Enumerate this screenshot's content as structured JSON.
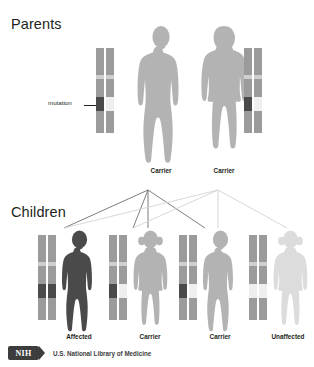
{
  "diagram": {
    "title_parents": "Parents",
    "title_children": "Children",
    "mutation_label": "mutation",
    "colors": {
      "chromosome_body": "#9b9b9b",
      "centromere_band": "#cfcfcf",
      "mutant_allele": "#4a4a4a",
      "normal_allele": "#efefef",
      "figure_carrier": "#b3b3b3",
      "figure_affected": "#4a4a4a",
      "figure_unaffected": "#dcdcdc",
      "line_dark": "#6e6e6e",
      "line_light": "#d2d2d2",
      "text": "#231f20",
      "nih_logo": "#3d3d3d"
    },
    "parents": [
      {
        "id": "father",
        "label": "Carrier",
        "sex": "male",
        "figure_shade": "carrier",
        "chromosomes": [
          {
            "allele": "mutation"
          },
          {
            "allele": "normal"
          }
        ]
      },
      {
        "id": "mother",
        "label": "Carrier",
        "sex": "female",
        "figure_shade": "carrier",
        "chromosomes": [
          {
            "allele": "mutation"
          },
          {
            "allele": "normal"
          }
        ]
      }
    ],
    "children": [
      {
        "id": "child-1",
        "label": "Affected",
        "sex": "male",
        "figure_shade": "affected",
        "chromosomes": [
          {
            "allele": "mutation"
          },
          {
            "allele": "mutation"
          }
        ]
      },
      {
        "id": "child-2",
        "label": "Carrier",
        "sex": "female",
        "figure_shade": "carrier",
        "chromosomes": [
          {
            "allele": "mutation"
          },
          {
            "allele": "normal"
          }
        ]
      },
      {
        "id": "child-3",
        "label": "Carrier",
        "sex": "male",
        "figure_shade": "carrier",
        "chromosomes": [
          {
            "allele": "mutation"
          },
          {
            "allele": "normal"
          }
        ]
      },
      {
        "id": "child-4",
        "label": "Unaffected",
        "sex": "female",
        "figure_shade": "unaffected",
        "chromosomes": [
          {
            "allele": "normal"
          },
          {
            "allele": "normal"
          }
        ]
      }
    ]
  },
  "footer": {
    "logo_text": "NIH",
    "agency": "U.S. National Library of Medicine"
  }
}
